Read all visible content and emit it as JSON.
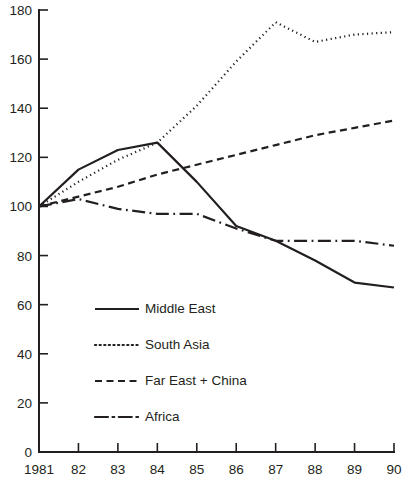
{
  "chart_data": {
    "type": "line",
    "title": "",
    "subtitle": "",
    "xlabel": "",
    "ylabel": "",
    "x": [
      1981,
      1982,
      1983,
      1984,
      1985,
      1986,
      1987,
      1988,
      1989,
      1990
    ],
    "x_tick_labels": [
      "1981",
      "82",
      "83",
      "84",
      "85",
      "86",
      "87",
      "88",
      "89",
      "90"
    ],
    "y_tick_labels": [
      "0",
      "20",
      "40",
      "60",
      "80",
      "100",
      "120",
      "140",
      "160",
      "180"
    ],
    "y_ticks": [
      0,
      20,
      40,
      60,
      80,
      100,
      120,
      140,
      160,
      180
    ],
    "ylim": [
      0,
      180
    ],
    "xlim": [
      1981,
      1990
    ],
    "grid": false,
    "legend_position": "inside-lower-left",
    "series": [
      {
        "name": "Middle East",
        "style": "solid",
        "color": "#231f20",
        "values": [
          100,
          115,
          123,
          126,
          110,
          92,
          86,
          78,
          69,
          67
        ]
      },
      {
        "name": "South Asia",
        "style": "dotted",
        "color": "#231f20",
        "values": [
          100,
          110,
          119,
          126,
          141,
          159,
          175,
          167,
          170,
          171
        ]
      },
      {
        "name": "Far East + China",
        "style": "dashed",
        "color": "#231f20",
        "values": [
          100,
          104,
          108,
          113,
          117,
          121,
          125,
          129,
          132,
          135
        ]
      },
      {
        "name": "Africa",
        "style": "dashdot",
        "color": "#231f20",
        "values": [
          100,
          103,
          99,
          97,
          97,
          91,
          86,
          86,
          86,
          84
        ]
      }
    ]
  },
  "legend": {
    "items": [
      {
        "label": "Middle East"
      },
      {
        "label": "South Asia"
      },
      {
        "label": "Far East + China"
      },
      {
        "label": "Africa"
      }
    ]
  },
  "axes": {
    "y_labels": [
      "180",
      "160",
      "140",
      "120",
      "100",
      "80",
      "60",
      "40",
      "20",
      "0"
    ],
    "x_labels": [
      "1981",
      "82",
      "83",
      "84",
      "85",
      "86",
      "87",
      "88",
      "89",
      "90"
    ]
  },
  "colors": {
    "ink": "#231f20",
    "background": "#ffffff"
  }
}
